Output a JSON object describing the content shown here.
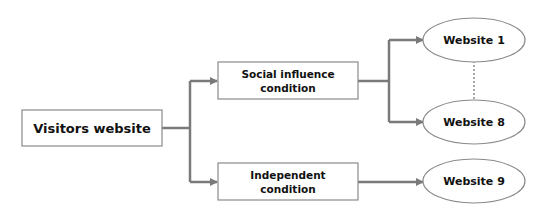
{
  "diagram": {
    "colors": {
      "line": "#7a7a7a",
      "border": "#8a8a8a",
      "text": "#111111",
      "background": "#ffffff"
    },
    "nodes": {
      "visitors": {
        "shape": "rectangle",
        "lines": [
          "Visitors website"
        ]
      },
      "social": {
        "shape": "rectangle",
        "lines": [
          "Social influence",
          "condition"
        ]
      },
      "independent": {
        "shape": "rectangle",
        "lines": [
          "Independent",
          "condition"
        ]
      },
      "website1": {
        "shape": "ellipse",
        "label": "Website 1"
      },
      "website8": {
        "shape": "ellipse",
        "label": "Website 8"
      },
      "website9": {
        "shape": "ellipse",
        "label": "Website 9"
      }
    },
    "edges": [
      {
        "from": "visitors",
        "to": "social",
        "style": "arrow"
      },
      {
        "from": "visitors",
        "to": "independent",
        "style": "arrow"
      },
      {
        "from": "social",
        "to": "website1",
        "style": "arrow"
      },
      {
        "from": "social",
        "to": "website8",
        "style": "arrow"
      },
      {
        "from": "independent",
        "to": "website9",
        "style": "arrow"
      },
      {
        "from": "website1",
        "to": "website8",
        "style": "dotted"
      }
    ]
  }
}
